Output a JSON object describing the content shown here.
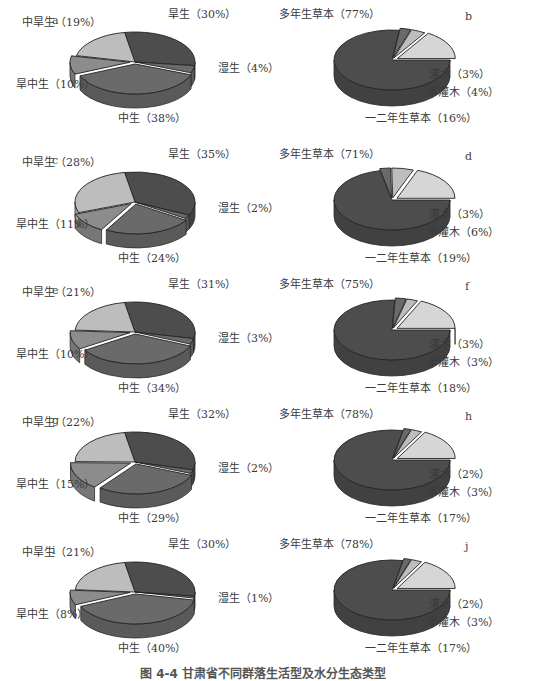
{
  "caption": "图 4-4  甘肃省不同群落生活型及水分生态类型",
  "colors": {
    "dark": "#4d4d4d",
    "mid_dark": "#6a6a6a",
    "mid": "#8c8c8c",
    "light": "#bdbdbd",
    "very_light": "#d6d6d6"
  },
  "chart_data": [
    {
      "panel": "a",
      "type": "pie",
      "subtype": "3d-exploded",
      "categories": [
        "旱生",
        "湿生",
        "中生",
        "旱中生",
        "中旱生"
      ],
      "values": [
        30,
        4,
        38,
        10,
        19
      ],
      "labels": [
        "旱生（30%）",
        "湿生（4%）",
        "中生（38%）",
        "旱中生（10%）",
        "中旱生（19%）"
      ]
    },
    {
      "panel": "b",
      "type": "pie",
      "subtype": "3d-exploded",
      "categories": [
        "多年生草本",
        "灌木",
        "半灌木",
        "一二年生草本"
      ],
      "values": [
        77,
        3,
        4,
        16
      ],
      "labels": [
        "多年生草本（77%）",
        "灌木（3%）",
        "半灌木（4%）",
        "一二年生草本（16%）"
      ]
    },
    {
      "panel": "c",
      "type": "pie",
      "subtype": "3d-exploded",
      "categories": [
        "旱生",
        "湿生",
        "中生",
        "旱中生",
        "中旱生"
      ],
      "values": [
        35,
        2,
        24,
        11,
        28
      ],
      "labels": [
        "旱生（35%）",
        "湿生（2%）",
        "中生（24%）",
        "旱中生（11%）",
        "中旱生（28%）"
      ]
    },
    {
      "panel": "d",
      "type": "pie",
      "subtype": "3d-exploded",
      "categories": [
        "多年生草本",
        "灌木",
        "半灌木",
        "一二年生草本"
      ],
      "values": [
        71,
        3,
        6,
        19
      ],
      "labels": [
        "多年生草本（71%）",
        "灌木（3%）",
        "半灌木（6%）",
        "一二年生草本（19%）"
      ]
    },
    {
      "panel": "e",
      "type": "pie",
      "subtype": "3d-exploded",
      "categories": [
        "旱生",
        "湿生",
        "中生",
        "旱中生",
        "中旱生"
      ],
      "values": [
        31,
        3,
        34,
        10,
        21
      ],
      "labels": [
        "旱生（31%）",
        "湿生（3%）",
        "中生（34%）",
        "旱中生（10%）",
        "中旱生（21%）"
      ]
    },
    {
      "panel": "f",
      "type": "pie",
      "subtype": "3d-exploded",
      "categories": [
        "多年生草本",
        "灌木",
        "半灌木",
        "一二年生草本"
      ],
      "values": [
        75,
        3,
        3,
        18
      ],
      "labels": [
        "多年生草本（75%）",
        "灌木（3%）",
        "半灌木（3%）",
        "一二年生草本（18%）"
      ]
    },
    {
      "panel": "g",
      "type": "pie",
      "subtype": "3d-exploded",
      "categories": [
        "旱生",
        "湿生",
        "中生",
        "旱中生",
        "中旱生"
      ],
      "values": [
        32,
        2,
        29,
        15,
        22
      ],
      "labels": [
        "旱生（32%）",
        "湿生（2%）",
        "中生（29%）",
        "旱中生（15%）",
        "中旱生（22%）"
      ]
    },
    {
      "panel": "h",
      "type": "pie",
      "subtype": "3d-exploded",
      "categories": [
        "多年生草本",
        "灌木",
        "半灌木",
        "一二年生草本"
      ],
      "values": [
        78,
        2,
        3,
        17
      ],
      "labels": [
        "多年生草本（78%）",
        "灌木（2%）",
        "半灌木（3%）",
        "一二年生草本（17%）"
      ]
    },
    {
      "panel": "i",
      "type": "pie",
      "subtype": "3d-exploded",
      "categories": [
        "旱生",
        "湿生",
        "中生",
        "旱中生",
        "中旱生"
      ],
      "values": [
        30,
        1,
        40,
        8,
        21
      ],
      "labels": [
        "旱生（30%）",
        "湿生（1%）",
        "中生（40%）",
        "旱中生（8%）",
        "中旱生（21%）"
      ]
    },
    {
      "panel": "j",
      "type": "pie",
      "subtype": "3d-exploded",
      "categories": [
        "多年生草本",
        "灌木",
        "半灌木",
        "一二年生草本"
      ],
      "values": [
        78,
        2,
        3,
        17
      ],
      "labels": [
        "多年生草本（78%）",
        "灌木（2%）",
        "半灌木（3%）",
        "一二年生草本（17%）"
      ]
    }
  ]
}
